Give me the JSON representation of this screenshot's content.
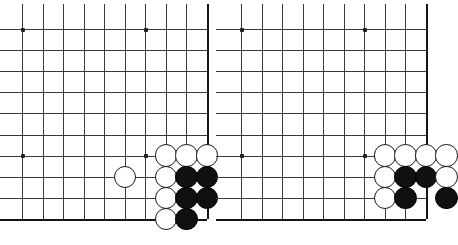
{
  "figure": {
    "title": "",
    "type": "go-board-diagram",
    "panel_count": 2,
    "background_color": "#ffffff",
    "line_color": "#3a3a3a",
    "edge_color": "#151515",
    "black_stone_color": "#101010",
    "white_stone_color": "#ffffff"
  },
  "boards": [
    {
      "name": "left-board",
      "origin_x": 22,
      "origin_y": 29,
      "cols": 10,
      "rows": 10,
      "spacing_x": 20.55,
      "spacing_y": 21.1,
      "edges": {
        "right": true,
        "bottom": true,
        "top": false,
        "left": false
      },
      "star_points": [
        {
          "col": 0,
          "row": 0
        },
        {
          "col": 6,
          "row": 0
        },
        {
          "col": 0,
          "row": 6
        },
        {
          "col": 6,
          "row": 6
        }
      ],
      "stones": [
        {
          "color": "white",
          "col": 5,
          "row": 7
        },
        {
          "color": "white",
          "col": 7,
          "row": 6
        },
        {
          "color": "white",
          "col": 8,
          "row": 6
        },
        {
          "color": "white",
          "col": 9,
          "row": 6
        },
        {
          "color": "white",
          "col": 7,
          "row": 7
        },
        {
          "color": "black",
          "col": 8,
          "row": 7
        },
        {
          "color": "black",
          "col": 9,
          "row": 7
        },
        {
          "color": "white",
          "col": 7,
          "row": 8
        },
        {
          "color": "black",
          "col": 8,
          "row": 8
        },
        {
          "color": "black",
          "col": 9,
          "row": 8
        },
        {
          "color": "white",
          "col": 7,
          "row": 9
        },
        {
          "color": "black",
          "col": 8,
          "row": 9
        }
      ]
    },
    {
      "name": "right-board",
      "origin_x": 241,
      "origin_y": 29,
      "cols": 10,
      "rows": 10,
      "spacing_x": 20.55,
      "spacing_y": 21.1,
      "edges": {
        "right": true,
        "bottom": true,
        "top": false,
        "left": false
      },
      "star_points": [
        {
          "col": 0,
          "row": 0
        },
        {
          "col": 6,
          "row": 0
        },
        {
          "col": 0,
          "row": 6
        },
        {
          "col": 6,
          "row": 6
        }
      ],
      "stones": [
        {
          "color": "white",
          "col": 7,
          "row": 6
        },
        {
          "color": "white",
          "col": 8,
          "row": 6
        },
        {
          "color": "white",
          "col": 9,
          "row": 6
        },
        {
          "color": "white",
          "col": 10,
          "row": 6
        },
        {
          "color": "white",
          "col": 7,
          "row": 7
        },
        {
          "color": "black",
          "col": 8,
          "row": 7
        },
        {
          "color": "black",
          "col": 9,
          "row": 7
        },
        {
          "color": "white",
          "col": 10,
          "row": 7
        },
        {
          "color": "white",
          "col": 7,
          "row": 8
        },
        {
          "color": "black",
          "col": 8,
          "row": 8
        },
        {
          "color": "black",
          "col": 10,
          "row": 8
        }
      ]
    }
  ],
  "stone_radius": 11.2
}
